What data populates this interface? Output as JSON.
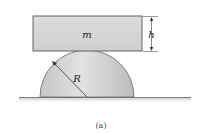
{
  "figure": {
    "block_label": "m",
    "height_label": "h",
    "radius_label": "R",
    "caption": "(a)"
  },
  "colors": {
    "block_fill": "#d6d6d6",
    "block_stroke": "#555555",
    "dome_fill_light": "#e4e4e4",
    "dome_fill_dark": "#bdbdbd",
    "ground": "#8a8a8a"
  }
}
